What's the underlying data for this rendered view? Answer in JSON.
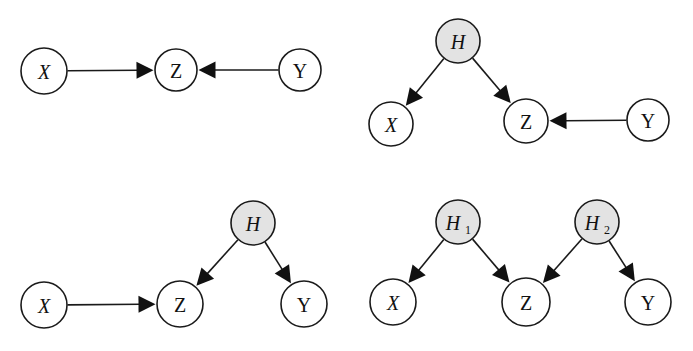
{
  "figure": {
    "background_color": "#ffffff",
    "stroke_color": "#1a1a1a",
    "arrow_color": "#111111",
    "shaded_node_color": "#e3e3e3",
    "unshaded_node_color": "#ffffff",
    "width": 693,
    "height": 351
  },
  "panels": [
    {
      "id": "panel-a",
      "position": "top-left",
      "caption": "",
      "nodes": [
        {
          "id": "a-x",
          "label": "X",
          "shaded": false,
          "cx": 44,
          "cy": 71,
          "r": 23,
          "label_style": "italic"
        },
        {
          "id": "a-z",
          "label": "Z",
          "shaded": false,
          "cx": 176,
          "cy": 70,
          "r": 21,
          "label_style": "upright"
        },
        {
          "id": "a-y",
          "label": "Y",
          "shaded": false,
          "cx": 300,
          "cy": 70,
          "r": 21,
          "label_style": "upright"
        }
      ],
      "edges": [
        {
          "from": "a-x",
          "to": "a-z",
          "type": "directed"
        },
        {
          "from": "a-y",
          "to": "a-z",
          "type": "directed"
        }
      ]
    },
    {
      "id": "panel-b",
      "position": "top-right",
      "caption": "",
      "nodes": [
        {
          "id": "b-h",
          "label": "H",
          "shaded": true,
          "cx": 458,
          "cy": 41,
          "r": 22,
          "label_style": "italic"
        },
        {
          "id": "b-x",
          "label": "X",
          "shaded": false,
          "cx": 391,
          "cy": 124,
          "r": 22,
          "label_style": "italic"
        },
        {
          "id": "b-z",
          "label": "Z",
          "shaded": false,
          "cx": 526,
          "cy": 121,
          "r": 22,
          "label_style": "upright"
        },
        {
          "id": "b-y",
          "label": "Y",
          "shaded": false,
          "cx": 648,
          "cy": 120,
          "r": 21,
          "label_style": "upright"
        }
      ],
      "edges": [
        {
          "from": "b-h",
          "to": "b-x",
          "type": "directed"
        },
        {
          "from": "b-h",
          "to": "b-z",
          "type": "directed"
        },
        {
          "from": "b-y",
          "to": "b-z",
          "type": "directed"
        }
      ]
    },
    {
      "id": "panel-c",
      "position": "bottom-left",
      "caption": "",
      "nodes": [
        {
          "id": "c-h",
          "label": "H",
          "shaded": true,
          "cx": 253,
          "cy": 223,
          "r": 22,
          "label_style": "italic"
        },
        {
          "id": "c-x",
          "label": "X",
          "shaded": false,
          "cx": 44,
          "cy": 305,
          "r": 23,
          "label_style": "italic"
        },
        {
          "id": "c-z",
          "label": "Z",
          "shaded": false,
          "cx": 180,
          "cy": 304,
          "r": 23,
          "label_style": "upright"
        },
        {
          "id": "c-y",
          "label": "Y",
          "shaded": false,
          "cx": 304,
          "cy": 304,
          "r": 23,
          "label_style": "upright"
        }
      ],
      "edges": [
        {
          "from": "c-x",
          "to": "c-z",
          "type": "directed"
        },
        {
          "from": "c-h",
          "to": "c-z",
          "type": "directed"
        },
        {
          "from": "c-h",
          "to": "c-y",
          "type": "directed"
        }
      ]
    },
    {
      "id": "panel-d",
      "position": "bottom-right",
      "caption": "",
      "nodes": [
        {
          "id": "d-h1",
          "label": "H",
          "subscript": "1",
          "shaded": true,
          "cx": 458,
          "cy": 222,
          "r": 22,
          "label_style": "italic"
        },
        {
          "id": "d-h2",
          "label": "H",
          "subscript": "2",
          "shaded": true,
          "cx": 597,
          "cy": 222,
          "r": 22,
          "label_style": "italic"
        },
        {
          "id": "d-x",
          "label": "X",
          "shaded": false,
          "cx": 393,
          "cy": 302,
          "r": 23,
          "label_style": "italic"
        },
        {
          "id": "d-z",
          "label": "Z",
          "shaded": false,
          "cx": 526,
          "cy": 302,
          "r": 24,
          "label_style": "upright"
        },
        {
          "id": "d-y",
          "label": "Y",
          "shaded": false,
          "cx": 648,
          "cy": 302,
          "r": 23,
          "label_style": "upright"
        }
      ],
      "edges": [
        {
          "from": "d-h1",
          "to": "d-x",
          "type": "directed"
        },
        {
          "from": "d-h1",
          "to": "d-z",
          "type": "directed"
        },
        {
          "from": "d-h2",
          "to": "d-z",
          "type": "directed"
        },
        {
          "from": "d-h2",
          "to": "d-y",
          "type": "directed"
        }
      ]
    }
  ],
  "legend": {
    "shaded_meaning": "latent / unobserved variable",
    "unshaded_meaning": "observed variable"
  }
}
